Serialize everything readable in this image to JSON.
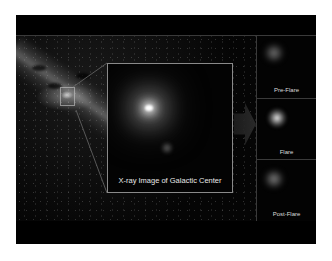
{
  "figure": {
    "main_view": {
      "label": "Infrared View of Milky Way"
    },
    "inset": {
      "caption": "X-ray Image of Galactic Center"
    },
    "panels": [
      {
        "label": "Pre-Flare"
      },
      {
        "label": "Flare"
      },
      {
        "label": "Post-Flare"
      }
    ],
    "colors": {
      "background": "#000000",
      "frame_line": "#3a3a3a",
      "inset_border": "#8a8a8a",
      "label_text": "#e0e0e0"
    }
  }
}
